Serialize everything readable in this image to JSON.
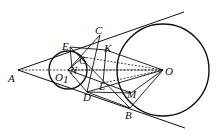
{
  "diagram": {
    "type": "geometry",
    "stroke_color": "#111111",
    "background": "#ffffff",
    "points": {
      "A": {
        "x": 18,
        "y": 70,
        "label": "A",
        "lx": 8,
        "ly": 82
      },
      "O1": {
        "x": 68,
        "y": 70,
        "label": "O",
        "sub": "1",
        "lx": 55,
        "ly": 81
      },
      "O": {
        "x": 163,
        "y": 70,
        "label": "O",
        "lx": 165,
        "ly": 75
      },
      "C": {
        "x": 100,
        "y": 35,
        "label": "C",
        "lx": 95,
        "ly": 34
      },
      "E": {
        "x": 70,
        "y": 47,
        "label": "E",
        "lx": 62,
        "ly": 50
      },
      "K": {
        "x": 106,
        "y": 50,
        "label": "K",
        "lx": 104,
        "ly": 52
      },
      "G": {
        "x": 83,
        "y": 57,
        "label": "G",
        "lx": 79,
        "ly": 64
      },
      "N": {
        "x": 72,
        "y": 68,
        "label": "N",
        "lx": 70,
        "ly": 74
      },
      "D": {
        "x": 87,
        "y": 92,
        "label": "D",
        "lx": 83,
        "ly": 101
      },
      "L": {
        "x": 103,
        "y": 83,
        "label": "L",
        "lx": 99,
        "ly": 90
      },
      "M": {
        "x": 131,
        "y": 93,
        "label": "M",
        "lx": 127,
        "ly": 98
      },
      "B": {
        "x": 130,
        "y": 108,
        "label": "B",
        "lx": 125,
        "ly": 119
      }
    },
    "circles": [
      {
        "name": "small-circle-O1",
        "cx": 68,
        "cy": 70,
        "r": 19
      },
      {
        "name": "large-circle-O",
        "cx": 163,
        "cy": 70,
        "r": 46
      }
    ],
    "tangent_lines": [
      {
        "name": "upper-tangent",
        "x1": 18,
        "y1": 70,
        "x2": 184,
        "y2": 12
      },
      {
        "name": "lower-tangent",
        "x1": 18,
        "y1": 70,
        "x2": 185,
        "y2": 128
      }
    ]
  }
}
